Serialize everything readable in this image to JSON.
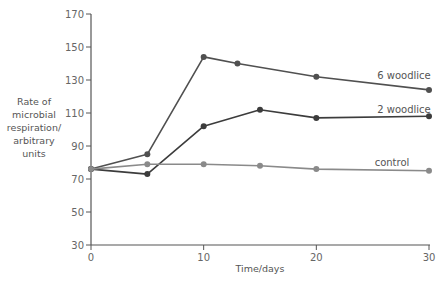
{
  "chart_data": {
    "type": "line",
    "title": "",
    "xlabel": "Time/days",
    "ylabel": "Rate of microbial respiration/ arbitrary units",
    "ylabel_lines": [
      "Rate of",
      "microbial",
      "respiration/",
      "arbitrary",
      "units"
    ],
    "xlim": [
      0,
      30
    ],
    "ylim": [
      30,
      170
    ],
    "xticks": [
      0,
      10,
      20,
      30
    ],
    "yticks": [
      30,
      50,
      70,
      90,
      110,
      130,
      150,
      170
    ],
    "grid": false,
    "legend": "inline-labels",
    "series": [
      {
        "name": "6 woodlice",
        "color": "#505050",
        "x": [
          0,
          5,
          10,
          13,
          20,
          30
        ],
        "y": [
          76,
          85,
          144,
          140,
          132,
          124
        ]
      },
      {
        "name": "2 woodlice",
        "color": "#3c3c3c",
        "x": [
          0,
          5,
          10,
          15,
          20,
          30
        ],
        "y": [
          76,
          73,
          102,
          112,
          107,
          108
        ]
      },
      {
        "name": "control",
        "color": "#8a8a8a",
        "x": [
          0,
          5,
          10,
          15,
          20,
          30
        ],
        "y": [
          76,
          79,
          79,
          78,
          76,
          75
        ]
      }
    ]
  }
}
